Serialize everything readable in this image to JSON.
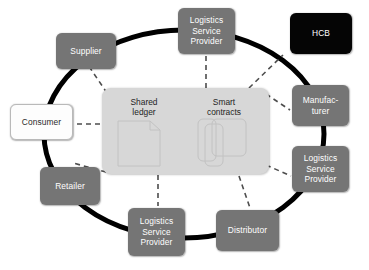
{
  "diagram": {
    "type": "hub-and-ring network diagram",
    "colors": {
      "node_fill": "#757575",
      "node_text": "#ffffff",
      "dark_node_fill": "#050505",
      "light_node_fill": "#fdfdfd",
      "light_node_text": "#2b2b2b",
      "hub_fill": "#d7d7d7",
      "ring_stroke": "#000000",
      "dashed_stroke": "#4d4d4d",
      "background": "#ffffff"
    },
    "hub": {
      "name": "shared-platform",
      "ledger_label": "Shared\nledger",
      "contracts_label": "Smart\ncontracts",
      "ledger_icon": "document-page-icon",
      "contracts_icon": "stacked-documents-icon"
    },
    "nodes": [
      {
        "id": "logistics-top",
        "label": "Logistics\nService\nProvider",
        "style": "gray",
        "x": 178,
        "y": 8,
        "w": 57,
        "h": 46
      },
      {
        "id": "hcb",
        "label": "HCB",
        "style": "dark",
        "x": 290,
        "y": 13,
        "w": 62,
        "h": 41
      },
      {
        "id": "supplier",
        "label": "Supplier",
        "style": "gray",
        "x": 56,
        "y": 33,
        "w": 60,
        "h": 36
      },
      {
        "id": "manufacturer",
        "label": "Manufac-\nturer",
        "style": "gray",
        "x": 292,
        "y": 85,
        "w": 57,
        "h": 41
      },
      {
        "id": "consumer",
        "label": "Consumer",
        "style": "light",
        "x": 10,
        "y": 104,
        "w": 63,
        "h": 36
      },
      {
        "id": "logistics-right",
        "label": "Logistics\nService\nProvider",
        "style": "gray",
        "x": 292,
        "y": 146,
        "w": 57,
        "h": 46
      },
      {
        "id": "retailer",
        "label": "Retailer",
        "style": "gray",
        "x": 40,
        "y": 167,
        "w": 60,
        "h": 38
      },
      {
        "id": "logistics-bottom",
        "label": "Logistics\nService\nProvider",
        "style": "gray",
        "x": 128,
        "y": 208,
        "w": 57,
        "h": 48
      },
      {
        "id": "distributor",
        "label": "Distributor",
        "style": "gray",
        "x": 216,
        "y": 210,
        "w": 63,
        "h": 41
      }
    ],
    "ring": {
      "name": "supply-chain-ring",
      "shape": "ellipse",
      "cx": 184,
      "cy": 134,
      "rx": 140,
      "ry": 104,
      "stroke_width": 5
    },
    "dashed_links": [
      {
        "from": "hub",
        "to": "supplier"
      },
      {
        "from": "hub",
        "to": "logistics-top"
      },
      {
        "from": "hub",
        "to": "manufacturer"
      },
      {
        "from": "hub",
        "to": "logistics-right"
      },
      {
        "from": "hub",
        "to": "distributor"
      },
      {
        "from": "hub",
        "to": "logistics-bottom"
      },
      {
        "from": "hub",
        "to": "retailer"
      },
      {
        "from": "hub",
        "to": "consumer"
      },
      {
        "from": "hub",
        "to": "hcb"
      }
    ]
  }
}
